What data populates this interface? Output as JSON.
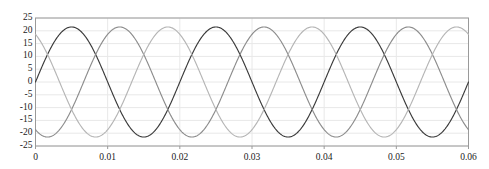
{
  "chart_data": {
    "type": "line",
    "title": "",
    "subtitle": "",
    "xlabel": "",
    "ylabel": "",
    "xlim": [
      0,
      0.06
    ],
    "ylim": [
      -25,
      25
    ],
    "grid": true,
    "legend": "none",
    "x_ticks": [
      "0",
      "0.01",
      "0.02",
      "0.03",
      "0.04",
      "0.05",
      "0.06"
    ],
    "x_tick_values": [
      0,
      0.01,
      0.02,
      0.03,
      0.04,
      0.05,
      0.06
    ],
    "y_ticks": [
      "25",
      "20",
      "15",
      "10",
      "5",
      "0",
      "-5",
      "-10",
      "-15",
      "-20",
      "-25"
    ],
    "y_tick_values": [
      25,
      20,
      15,
      10,
      5,
      0,
      -5,
      -10,
      -15,
      -20,
      -25
    ],
    "amplitude": 21.5,
    "frequency_hz": 50,
    "period_s": 0.02,
    "series": [
      {
        "name": "phase-a",
        "color": "#3a3a3a",
        "amplitude": 21.5,
        "frequency_hz": 50,
        "phase_deg": 0,
        "x": [
          0,
          0.0025,
          0.005,
          0.0075,
          0.01,
          0.0125,
          0.015,
          0.0175,
          0.02,
          0.0225,
          0.025,
          0.0275,
          0.03,
          0.0325,
          0.035,
          0.0375,
          0.04,
          0.0425,
          0.045,
          0.0475,
          0.05,
          0.0525,
          0.055,
          0.0575,
          0.06
        ],
        "values": [
          0,
          15.2,
          21.5,
          15.2,
          0,
          -15.2,
          -21.5,
          -15.2,
          0,
          15.2,
          21.5,
          15.2,
          0,
          -15.2,
          -21.5,
          -15.2,
          0,
          15.2,
          21.5,
          15.2,
          0,
          -15.2,
          -21.5,
          -15.2,
          0
        ]
      },
      {
        "name": "phase-b",
        "color": "#8c8c8c",
        "amplitude": 21.5,
        "frequency_hz": 50,
        "phase_deg": -120,
        "x": [
          0,
          0.0025,
          0.005,
          0.0075,
          0.01,
          0.0125,
          0.015,
          0.0175,
          0.02,
          0.0225,
          0.025,
          0.0275,
          0.03,
          0.0325,
          0.035,
          0.0375,
          0.04,
          0.0425,
          0.045,
          0.0475,
          0.05,
          0.0525,
          0.055,
          0.0575,
          0.06
        ],
        "values": [
          -18.6,
          -5.6,
          10.8,
          20.3,
          18.6,
          5.6,
          -10.8,
          -20.3,
          -18.6,
          -5.6,
          10.8,
          20.3,
          18.6,
          5.6,
          -10.8,
          -20.3,
          -18.6,
          -5.6,
          10.8,
          20.3,
          18.6,
          5.6,
          -10.8,
          -20.3,
          -18.6
        ]
      },
      {
        "name": "phase-c",
        "color": "#b5b5b5",
        "amplitude": 21.5,
        "frequency_hz": 50,
        "phase_deg": 120,
        "x": [
          0,
          0.0025,
          0.005,
          0.0075,
          0.01,
          0.0125,
          0.015,
          0.0175,
          0.02,
          0.0225,
          0.025,
          0.0275,
          0.03,
          0.0325,
          0.035,
          0.0375,
          0.04,
          0.0425,
          0.045,
          0.0475,
          0.05,
          0.0525,
          0.055,
          0.0575,
          0.06
        ],
        "values": [
          18.6,
          20.3,
          10.8,
          -5.6,
          -18.6,
          -20.3,
          -10.8,
          5.6,
          18.6,
          20.3,
          10.8,
          -5.6,
          -18.6,
          -20.3,
          -10.8,
          5.6,
          18.6,
          20.3,
          10.8,
          -5.6,
          -18.6,
          -20.3,
          -10.8,
          5.6,
          18.6
        ]
      }
    ]
  },
  "style": {
    "axis_color": "#9a9a9a",
    "grid_color": "#e8e8e8",
    "tick_label_color": "#1a1a1a",
    "background": "#ffffff"
  }
}
